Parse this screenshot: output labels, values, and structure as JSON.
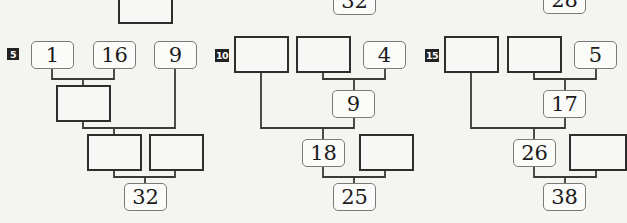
{
  "puzzles": [
    {
      "number": "5",
      "top_row": [
        "1",
        "16",
        "9"
      ],
      "middle": "",
      "lower_pair": [
        "",
        ""
      ],
      "result": "32"
    },
    {
      "number": "10",
      "top_row": [
        "",
        "",
        "4"
      ],
      "middle": "9",
      "lower_pair": [
        "18",
        ""
      ],
      "result": "25"
    },
    {
      "number": "15",
      "top_row": [
        "",
        "",
        "5"
      ],
      "middle": "17",
      "lower_pair": [
        "26",
        ""
      ],
      "result": "38"
    }
  ],
  "previous_row_partial": {
    "col1_blank_box": "",
    "col2_result": "32",
    "col3_result": "28"
  },
  "colors": {
    "background": "#f4f4f1",
    "line": "#3a3a3a",
    "blank_border": "#2e2e2e",
    "given_border": "#7a7a7a",
    "tag_bg": "#222222"
  }
}
